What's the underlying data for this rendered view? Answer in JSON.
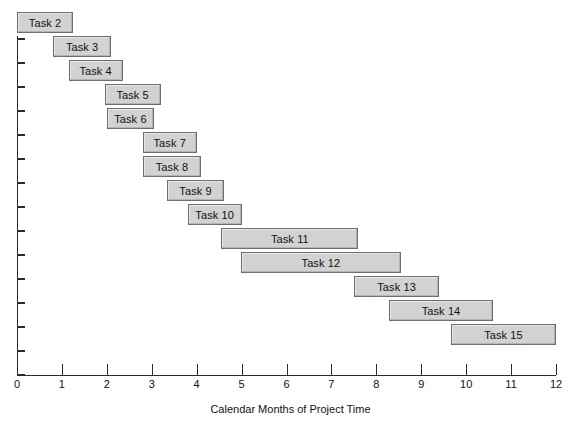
{
  "chart_data": {
    "type": "bar",
    "subtype": "gantt",
    "title": "",
    "xlabel": "Calendar Months of Project Time",
    "ylabel": "",
    "xlim": [
      0,
      12
    ],
    "xticks": [
      0,
      1,
      2,
      3,
      4,
      5,
      6,
      7,
      8,
      9,
      10,
      11,
      12
    ],
    "xtick_labels": [
      "0",
      "1",
      "2",
      "3",
      "4",
      "5",
      "6",
      "7",
      "8",
      "9",
      "10",
      "11",
      "12"
    ],
    "grid": false,
    "legend": "none",
    "y_tick_count": 15,
    "bar_fill_color": "#d2d2d2",
    "bar_border_color": "#6e6e6e",
    "axis_color": "#2b2b2b",
    "categories": [
      "Task 2",
      "Task 3",
      "Task 4",
      "Task 5",
      "Task 6",
      "Task 7",
      "Task 8",
      "Task 9",
      "Task 10",
      "Task 11",
      "Task 12",
      "Task 13",
      "Task 14",
      "Task 15"
    ],
    "tasks": [
      {
        "label": "Task 2",
        "start": 0.0,
        "end": 1.25,
        "duration": 1.25
      },
      {
        "label": "Task 3",
        "start": 0.8,
        "end": 2.1,
        "duration": 1.3
      },
      {
        "label": "Task 4",
        "start": 1.15,
        "end": 2.35,
        "duration": 1.2
      },
      {
        "label": "Task 5",
        "start": 1.95,
        "end": 3.2,
        "duration": 1.25
      },
      {
        "label": "Task 6",
        "start": 2.0,
        "end": 3.05,
        "duration": 1.05
      },
      {
        "label": "Task 7",
        "start": 2.8,
        "end": 4.0,
        "duration": 1.2
      },
      {
        "label": "Task 8",
        "start": 2.8,
        "end": 4.1,
        "duration": 1.3
      },
      {
        "label": "Task 9",
        "start": 3.35,
        "end": 4.6,
        "duration": 1.25
      },
      {
        "label": "Task 10",
        "start": 3.8,
        "end": 5.0,
        "duration": 1.2
      },
      {
        "label": "Task 11",
        "start": 4.55,
        "end": 7.6,
        "duration": 3.05
      },
      {
        "label": "Task 12",
        "start": 4.98,
        "end": 8.55,
        "duration": 3.57
      },
      {
        "label": "Task 13",
        "start": 7.5,
        "end": 9.4,
        "duration": 1.9
      },
      {
        "label": "Task 14",
        "start": 8.28,
        "end": 10.6,
        "duration": 2.32
      },
      {
        "label": "Task 15",
        "start": 9.66,
        "end": 12.0,
        "duration": 2.34
      }
    ]
  }
}
